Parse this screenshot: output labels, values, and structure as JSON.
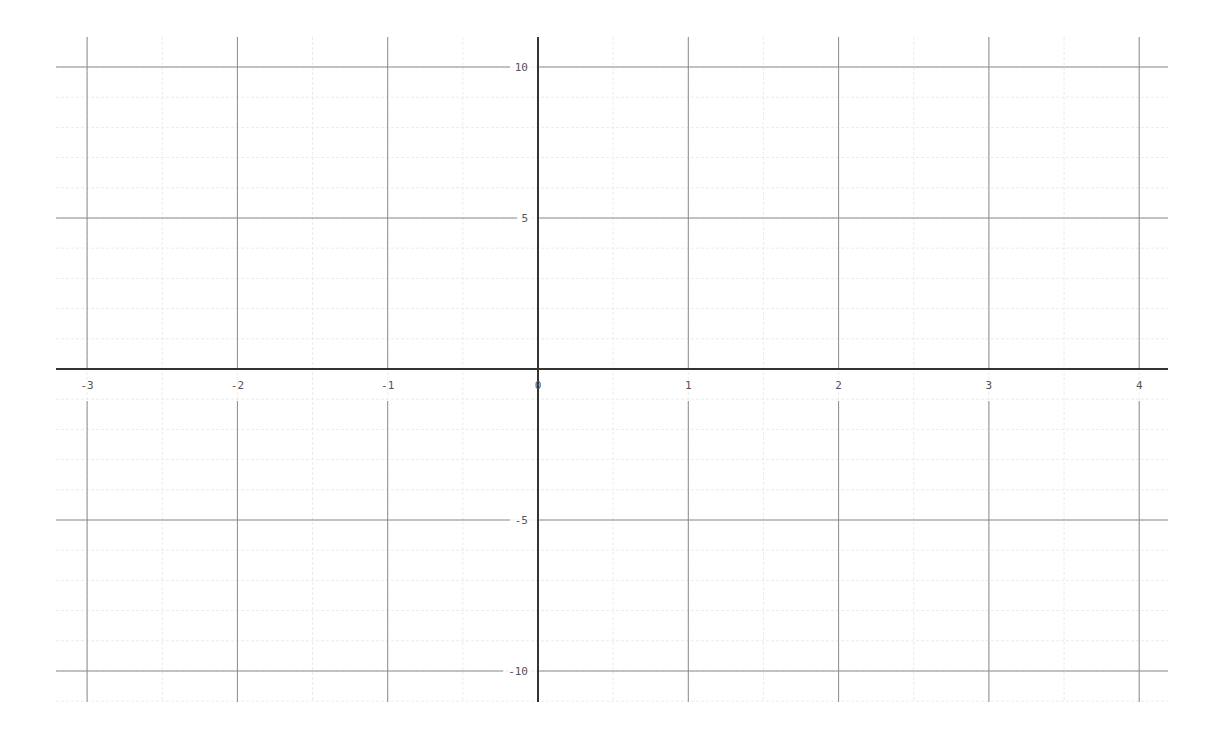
{
  "chart_data": {
    "type": "line",
    "title": "",
    "xlabel": "",
    "ylabel": "",
    "series": [],
    "xlim": [
      -3.2,
      4.2
    ],
    "ylim": [
      -11,
      11
    ],
    "x_ticks": [
      -3,
      -2,
      -1,
      0,
      1,
      2,
      3,
      4
    ],
    "x_tick_labels": [
      "-3",
      "-2",
      "-1",
      "0",
      "1",
      "2",
      "3",
      "4"
    ],
    "y_ticks": [
      10,
      5,
      -5,
      -10
    ],
    "y_tick_labels": [
      "10",
      "5",
      "-5",
      "-10"
    ],
    "grid": true,
    "minor_grid": true,
    "legend": null
  },
  "layout": {
    "origin_px": [
      538,
      369
    ],
    "px_per_x_unit": 150.3,
    "px_per_y_unit": 30.2,
    "x_axis_extent_px": [
      56,
      1168
    ],
    "y_axis_extent_px": [
      37,
      702
    ],
    "colors": {
      "axis": "#333333",
      "major_grid": "#8a8a8a",
      "minor_grid": "#ececec",
      "label": "#555555",
      "background": "#ffffff"
    }
  }
}
